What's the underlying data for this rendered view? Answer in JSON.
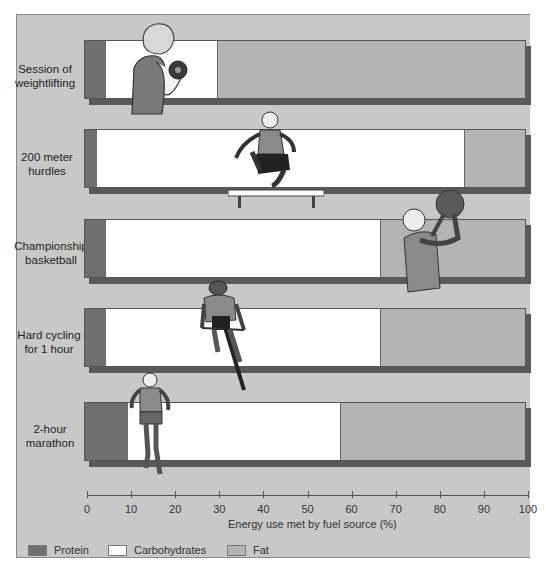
{
  "chart_data": {
    "type": "bar",
    "orientation": "horizontal",
    "stacked": true,
    "title": "",
    "xlabel": "Energy use met by fuel source (%)",
    "ylabel": "",
    "xlim": [
      0,
      100
    ],
    "x_ticks": [
      0,
      10,
      20,
      30,
      40,
      50,
      60,
      70,
      80,
      90,
      100
    ],
    "grid": false,
    "legend_position": "bottom",
    "categories": [
      "Session of weightlifting",
      "200 meter hurdles",
      "Championship basketball",
      "Hard cycling for 1 hour",
      "2-hour marathon"
    ],
    "series": [
      {
        "name": "Protein",
        "color": "#6f6f6f",
        "values": [
          5,
          3,
          5,
          5,
          10
        ]
      },
      {
        "name": "Carbohydrates",
        "color": "#ffffff",
        "values": [
          25,
          83,
          62,
          62,
          48
        ]
      },
      {
        "name": "Fat",
        "color": "#b4b4b4",
        "values": [
          70,
          14,
          33,
          33,
          42
        ]
      }
    ]
  },
  "rows": [
    {
      "label_line1": "Session of",
      "label_line2": "weightlifting",
      "protein": 5,
      "carbs": 25,
      "fat": 70,
      "illustration": "weightlifter-icon"
    },
    {
      "label_line1": "200 meter",
      "label_line2": "hurdles",
      "protein": 3,
      "carbs": 83,
      "fat": 14,
      "illustration": "hurdler-icon"
    },
    {
      "label_line1": "Championship",
      "label_line2": "basketball",
      "protein": 5,
      "carbs": 62,
      "fat": 33,
      "illustration": "basketball-player-icon"
    },
    {
      "label_line1": "Hard cycling",
      "label_line2": "for 1 hour",
      "protein": 5,
      "carbs": 62,
      "fat": 33,
      "illustration": "cyclist-icon"
    },
    {
      "label_line1": "2-hour",
      "label_line2": "marathon",
      "protein": 10,
      "carbs": 48,
      "fat": 42,
      "illustration": "runner-icon"
    }
  ],
  "axis": {
    "title": "Energy use met by fuel source (%)",
    "ticks": [
      "0",
      "10",
      "20",
      "30",
      "40",
      "50",
      "60",
      "70",
      "80",
      "90",
      "100"
    ]
  },
  "legend": [
    {
      "label": "Protein",
      "color": "#6f6f6f"
    },
    {
      "label": "Carbohydrates",
      "color": "#ffffff"
    },
    {
      "label": "Fat",
      "color": "#b4b4b4"
    }
  ],
  "colors": {
    "panel_background": "#c8c8c8",
    "protein": "#6f6f6f",
    "carbohydrates": "#ffffff",
    "fat": "#b4b4b4",
    "shadow": "#5a5a5a"
  }
}
